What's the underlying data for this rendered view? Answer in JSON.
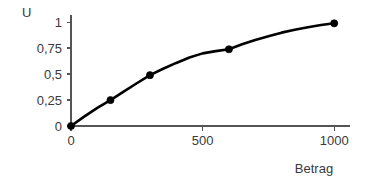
{
  "chart_data": {
    "type": "line",
    "title": "",
    "subtitle": "",
    "xlabel": "Betrag",
    "ylabel": "U",
    "xlim": [
      0,
      1060
    ],
    "ylim": [
      0,
      1.07
    ],
    "grid": false,
    "legend": "none",
    "x_ticks": [
      {
        "value": 0,
        "label": "0"
      },
      {
        "value": 500,
        "label": "500"
      },
      {
        "value": 1000,
        "label": "1000"
      }
    ],
    "y_ticks": [
      {
        "value": 0,
        "label": "0"
      },
      {
        "value": 0.25,
        "label": "0,25"
      },
      {
        "value": 0.5,
        "label": "0,5"
      },
      {
        "value": 0.75,
        "label": "0,75"
      },
      {
        "value": 1,
        "label": "1"
      }
    ],
    "series": [
      {
        "name": "U",
        "line_color": "#000000",
        "marker_color": "#000000",
        "points": [
          {
            "x": 0,
            "y": 0.0
          },
          {
            "x": 150,
            "y": 0.25
          },
          {
            "x": 300,
            "y": 0.49
          },
          {
            "x": 600,
            "y": 0.74
          },
          {
            "x": 1000,
            "y": 0.99
          }
        ],
        "curve": [
          {
            "x": 0,
            "y": 0.0
          },
          {
            "x": 50,
            "y": 0.09
          },
          {
            "x": 100,
            "y": 0.175
          },
          {
            "x": 150,
            "y": 0.25
          },
          {
            "x": 200,
            "y": 0.332
          },
          {
            "x": 250,
            "y": 0.412
          },
          {
            "x": 300,
            "y": 0.49
          },
          {
            "x": 350,
            "y": 0.552
          },
          {
            "x": 400,
            "y": 0.608
          },
          {
            "x": 450,
            "y": 0.66
          },
          {
            "x": 500,
            "y": 0.7
          },
          {
            "x": 550,
            "y": 0.722
          },
          {
            "x": 600,
            "y": 0.74
          },
          {
            "x": 650,
            "y": 0.788
          },
          {
            "x": 700,
            "y": 0.83
          },
          {
            "x": 750,
            "y": 0.866
          },
          {
            "x": 800,
            "y": 0.9
          },
          {
            "x": 850,
            "y": 0.928
          },
          {
            "x": 900,
            "y": 0.952
          },
          {
            "x": 950,
            "y": 0.974
          },
          {
            "x": 1000,
            "y": 0.99
          }
        ]
      }
    ],
    "colors": {
      "axis": "#555555",
      "curve": "#000000",
      "marker": "#000000",
      "text": "#3a3a3a",
      "background": "#ffffff"
    }
  }
}
